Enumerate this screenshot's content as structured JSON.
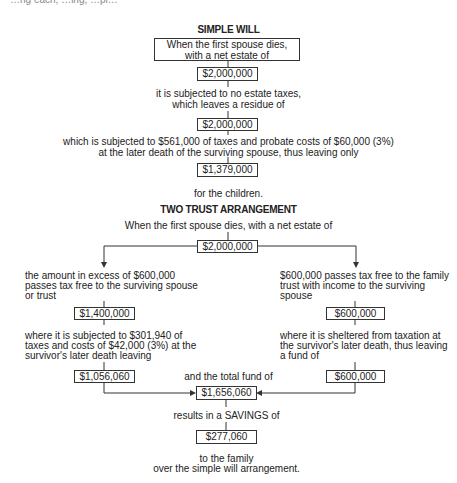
{
  "top_fragment": "…ng each, …ing, …pl…",
  "simple_will": {
    "title": "SIMPLE WILL",
    "intro_line1": "When the first spouse dies,",
    "intro_line2": "with a net estate of",
    "box1": "$2,000,000",
    "text2_line1": "it is subjected to no estate taxes,",
    "text2_line2": "which leaves a residue of",
    "box2": "$2,000,000",
    "text3_line1": "which is subjected to $561,000 of taxes and probate costs of $60,000 (3%)",
    "text3_line2": "at the later death of the surviving spouse, thus leaving only",
    "box3": "$1,379,000",
    "text4": "for the children."
  },
  "two_trust": {
    "title": "TWO TRUST ARRANGEMENT",
    "intro": "When the first spouse dies, with a net estate of",
    "box_estate": "$2,000,000",
    "left": {
      "text1_line1": "the amount in excess of $600,000",
      "text1_line2": "passes tax free to the surviving spouse",
      "text1_line3": "or trust",
      "box1": "$1,400,000",
      "text2_line1": "where it is subjected to $301,940 of",
      "text2_line2": "taxes and costs of $42,000 (3%) at the",
      "text2_line3": "survivor's later death leaving",
      "box2": "$1,056,060"
    },
    "right": {
      "text1_line1": "$600,000 passes tax free to the family",
      "text1_line2": "trust with income to the surviving",
      "text1_line3": "spouse",
      "box1": "$600,000",
      "text2_line1": "where it is sheltered from taxation at",
      "text2_line2": "the survivor's later death, thus leaving",
      "text2_line3": "a fund of",
      "box2": "$600,000"
    },
    "total_label": "and the total fund of",
    "box_total": "$1,656,060",
    "savings_label": "results in a SAVINGS of",
    "box_savings": "$277,060",
    "closing_line1": "to the family",
    "closing_line2": "over the simple will arrangement."
  }
}
